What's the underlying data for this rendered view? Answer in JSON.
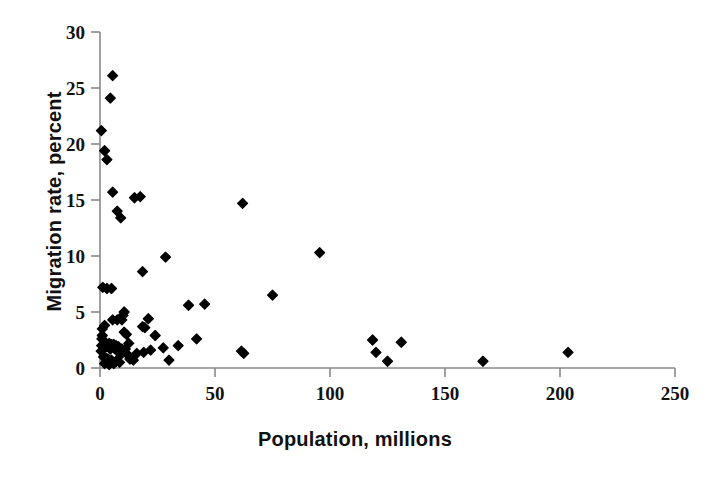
{
  "chart_data": {
    "type": "scatter",
    "title": "",
    "xlabel": "Population, millions",
    "ylabel": "Migration rate, percent",
    "xlim": [
      0,
      250
    ],
    "ylim": [
      0,
      30
    ],
    "xticks": [
      0,
      50,
      100,
      150,
      200,
      250
    ],
    "yticks": [
      0,
      5,
      10,
      15,
      20,
      25,
      30
    ],
    "xtick_labels": [
      "0",
      "50",
      "100",
      "150",
      "200",
      "250"
    ],
    "ytick_labels": [
      "0",
      "5",
      "10",
      "15",
      "20",
      "25",
      "30"
    ],
    "grid": false,
    "legend": null,
    "marker": "diamond",
    "marker_color": "#000000",
    "marker_size": 9,
    "series": [
      {
        "name": "Countries",
        "points": [
          [
            5.5,
            26.1
          ],
          [
            4.5,
            24.1
          ],
          [
            0.6,
            21.2
          ],
          [
            2.0,
            19.4
          ],
          [
            3.0,
            18.6
          ],
          [
            5.5,
            15.7
          ],
          [
            15.0,
            15.2
          ],
          [
            17.5,
            15.3
          ],
          [
            62.0,
            14.7
          ],
          [
            7.5,
            14.0
          ],
          [
            9.0,
            13.4
          ],
          [
            28.5,
            9.9
          ],
          [
            95.5,
            10.3
          ],
          [
            18.5,
            8.6
          ],
          [
            1.2,
            7.2
          ],
          [
            3.0,
            7.1
          ],
          [
            5.0,
            7.1
          ],
          [
            75.0,
            6.5
          ],
          [
            38.5,
            5.6
          ],
          [
            45.5,
            5.7
          ],
          [
            10.5,
            5.0
          ],
          [
            10.0,
            4.7
          ],
          [
            7.5,
            4.3
          ],
          [
            9.5,
            4.3
          ],
          [
            21.0,
            4.4
          ],
          [
            5.5,
            4.3
          ],
          [
            2.0,
            3.8
          ],
          [
            1.0,
            3.5
          ],
          [
            18.5,
            3.7
          ],
          [
            19.5,
            3.6
          ],
          [
            10.5,
            3.2
          ],
          [
            11.5,
            3.0
          ],
          [
            24.0,
            2.9
          ],
          [
            1.0,
            2.9
          ],
          [
            0.8,
            2.6
          ],
          [
            42.0,
            2.6
          ],
          [
            131.0,
            2.3
          ],
          [
            118.5,
            2.5
          ],
          [
            4.0,
            2.2
          ],
          [
            5.0,
            2.1
          ],
          [
            6.0,
            2.1
          ],
          [
            7.0,
            2.0
          ],
          [
            8.0,
            1.9
          ],
          [
            3.0,
            1.9
          ],
          [
            4.5,
            1.7
          ],
          [
            6.5,
            1.7
          ],
          [
            9.5,
            1.7
          ],
          [
            11.0,
            1.7
          ],
          [
            34.0,
            2.0
          ],
          [
            27.5,
            1.8
          ],
          [
            22.0,
            1.6
          ],
          [
            61.5,
            1.5
          ],
          [
            62.5,
            1.3
          ],
          [
            120.0,
            1.4
          ],
          [
            203.5,
            1.4
          ],
          [
            9.0,
            1.2
          ],
          [
            12.0,
            1.2
          ],
          [
            1.5,
            1.0
          ],
          [
            2.5,
            0.9
          ],
          [
            3.5,
            0.8
          ],
          [
            5.0,
            0.7
          ],
          [
            7.0,
            0.6
          ],
          [
            8.5,
            0.5
          ],
          [
            13.0,
            0.8
          ],
          [
            14.5,
            0.7
          ],
          [
            30.0,
            0.7
          ],
          [
            125.0,
            0.6
          ],
          [
            166.5,
            0.6
          ],
          [
            2.0,
            0.4
          ],
          [
            4.0,
            0.3
          ],
          [
            6.0,
            0.4
          ],
          [
            0.5,
            1.5
          ],
          [
            0.7,
            2.0
          ],
          [
            1.8,
            2.4
          ],
          [
            12.5,
            2.2
          ],
          [
            16.0,
            1.3
          ],
          [
            19.0,
            1.4
          ]
        ]
      }
    ]
  }
}
